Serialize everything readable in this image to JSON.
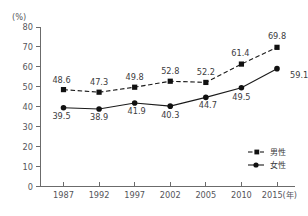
{
  "chart_data": {
    "type": "line",
    "title": "",
    "xlabel": "",
    "ylabel": "",
    "unit_label": "(%)",
    "x_unit_suffix": "(年)",
    "categories": [
      "1987",
      "1992",
      "1997",
      "2002",
      "2005",
      "2010",
      "2015"
    ],
    "x_tick_labels": [
      "1987",
      "1992",
      "1997",
      "2002",
      "2005",
      "2010",
      "2015(年)"
    ],
    "ylim": [
      0,
      80
    ],
    "y_ticks": [
      0,
      10,
      20,
      30,
      40,
      50,
      60,
      70,
      80
    ],
    "y_tick_labels": [
      "0",
      "10",
      "20",
      "30",
      "40",
      "50",
      "60",
      "70",
      "80"
    ],
    "grid": false,
    "legend_position": "bottom-right",
    "series": [
      {
        "name": "男性",
        "style": "dashed",
        "marker": "square",
        "color": "#111111",
        "values": [
          48.6,
          47.3,
          49.8,
          52.8,
          52.2,
          61.4,
          69.8
        ],
        "value_labels": [
          "48.6",
          "47.3",
          "49.8",
          "52.8",
          "52.2",
          "61.4",
          "69.8"
        ]
      },
      {
        "name": "女性",
        "style": "solid",
        "marker": "circle",
        "color": "#111111",
        "values": [
          39.5,
          38.9,
          41.9,
          40.3,
          44.7,
          49.5,
          59.1
        ],
        "value_labels": [
          "39.5",
          "38.9",
          "41.9",
          "40.3",
          "44.7",
          "49.5",
          "59.1"
        ]
      }
    ]
  },
  "legend": {
    "items": [
      {
        "label": "男性"
      },
      {
        "label": "女性"
      }
    ]
  }
}
